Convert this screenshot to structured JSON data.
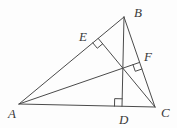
{
  "figure": {
    "canvas": {
      "width": 177,
      "height": 128,
      "background": "#fdfdfd"
    },
    "style": {
      "stroke_color": "#4b4b4b",
      "stroke_width": 1,
      "label_color": "#3a3a3a",
      "label_font_size": 13
    },
    "points": {
      "A": {
        "x": 19,
        "y": 104
      },
      "B": {
        "x": 124,
        "y": 17
      },
      "C": {
        "x": 155,
        "y": 107
      },
      "D": {
        "x": 122,
        "y": 106.3
      },
      "E": {
        "x": 98.2,
        "y": 38.4
      },
      "F": {
        "x": 139.6,
        "y": 62.4
      }
    },
    "segments": [
      {
        "name": "side-AB",
        "from": "A",
        "to": "B"
      },
      {
        "name": "side-BC",
        "from": "B",
        "to": "C"
      },
      {
        "name": "side-CA",
        "from": "C",
        "to": "A"
      },
      {
        "name": "altitude-BD",
        "from": "B",
        "to": "D"
      },
      {
        "name": "altitude-CE",
        "from": "C",
        "to": "E"
      },
      {
        "name": "altitude-AF",
        "from": "A",
        "to": "F"
      }
    ],
    "right_angle_marks": [
      {
        "name": "right-angle-at-E",
        "at": "E",
        "toward1": "A",
        "toward2": "C",
        "size": 7
      },
      {
        "name": "right-angle-at-F",
        "at": "F",
        "toward1": "C",
        "toward2": "A",
        "size": 7
      },
      {
        "name": "right-angle-at-D",
        "at": "D",
        "toward1": "A",
        "toward2": "B",
        "size": 7.5
      }
    ],
    "labels": [
      {
        "name": "label-A",
        "text": "A",
        "x": 8,
        "y": 118
      },
      {
        "name": "label-B",
        "text": "B",
        "x": 134,
        "y": 16.5
      },
      {
        "name": "label-C",
        "text": "C",
        "x": 161,
        "y": 117
      },
      {
        "name": "label-D",
        "text": "D",
        "x": 119,
        "y": 123.5
      },
      {
        "name": "label-E",
        "text": "E",
        "x": 79,
        "y": 41
      },
      {
        "name": "label-F",
        "text": "F",
        "x": 144,
        "y": 61
      }
    ]
  }
}
